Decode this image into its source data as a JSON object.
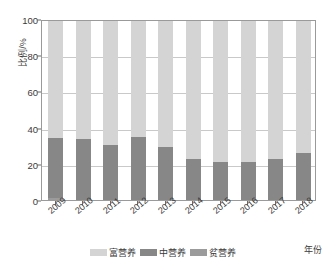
{
  "chart_data": {
    "type": "bar",
    "subtype": "stacked-100-percent",
    "title": "",
    "subtitle": "",
    "xlabel": "年份",
    "ylabel": "比例/%",
    "ylim": [
      0,
      100
    ],
    "yticks": [
      0,
      20,
      40,
      60,
      80,
      100
    ],
    "ytick_labels": [
      "0",
      "20",
      "40",
      "60",
      "80",
      "100"
    ],
    "grid": true,
    "grid_axis": "y",
    "legend_position": "bottom-center",
    "categories": [
      "2009",
      "2010",
      "2011",
      "2012",
      "2013",
      "2014",
      "2015",
      "2016",
      "2017",
      "2018"
    ],
    "series": [
      {
        "name": "贫营养",
        "color": "#9b9b9b",
        "values": [
          1.0,
          0.0,
          0.0,
          0.0,
          0.0,
          0.0,
          0.0,
          0.0,
          0.0,
          0.0
        ]
      },
      {
        "name": "中营养",
        "color": "#878787",
        "values": [
          33.5,
          33.5,
          30.5,
          35.0,
          29.5,
          22.5,
          21.0,
          21.0,
          22.5,
          26.0
        ]
      },
      {
        "name": "富营养",
        "color": "#d4d4d4",
        "values": [
          65.5,
          66.5,
          69.5,
          65.0,
          70.5,
          77.5,
          79.0,
          79.0,
          77.5,
          74.0
        ]
      }
    ]
  },
  "legend": {
    "items": [
      {
        "label": "富营养",
        "color": "#d4d4d4"
      },
      {
        "label": "中营养",
        "color": "#878787"
      },
      {
        "label": "贫营养",
        "color": "#9b9b9b"
      }
    ]
  },
  "axes": {
    "y_title": "比例/%",
    "x_title": "年份"
  },
  "colors": {
    "frame": "#9a9a9a",
    "grid": "#c9c9c9",
    "text": "#3a3a3a",
    "background": "#ffffff"
  }
}
